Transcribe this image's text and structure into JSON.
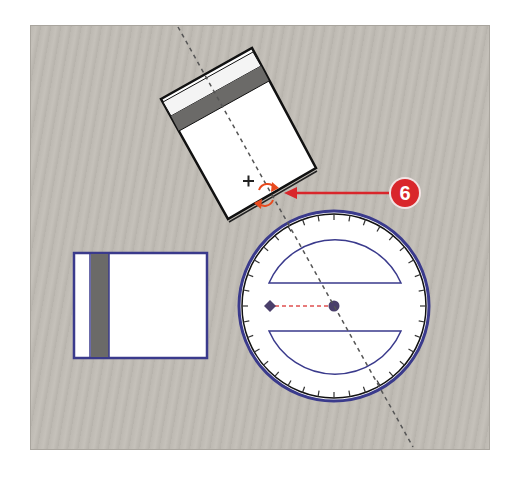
{
  "canvas": {
    "background": "#c0bcb5"
  },
  "callout": {
    "number": "6",
    "color": "#d9262b",
    "ring_color": "#f2e4e4"
  },
  "rotated_object": {
    "fill": "#ffffff",
    "band_color": "#6b6a68",
    "stroke": "#111111",
    "rotation_deg": -29
  },
  "reference_object": {
    "stroke": "#3a3a8c",
    "band_color": "#6b6a68"
  },
  "protractor": {
    "stroke": "#3a3a8c",
    "outer_stroke": "#111111",
    "tick_count": 36,
    "handle_color": "#4a3f6b",
    "guide_color": "#e05050"
  },
  "guide_line": {
    "color": "#555555"
  },
  "rotate_handle": {
    "color": "#e84a1e"
  }
}
